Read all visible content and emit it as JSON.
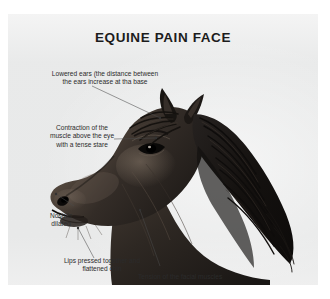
{
  "figure": {
    "title": "EQUINE PAIN FACE",
    "background_color": "#ffffff",
    "plate_color": "#e9eaea",
    "text_color": "#2b2b2b",
    "title_color": "#1c1c1c"
  },
  "annotations": [
    {
      "id": "lowered-ears",
      "text": "Lowered ears (the distance between\nthe ears increase at tha base"
    },
    {
      "id": "eye-muscle",
      "text": "Contraction of the\nmuscle above the eye\nwith a tense stare"
    },
    {
      "id": "nostrils",
      "text": "Nostrils\ndilated"
    },
    {
      "id": "lips-chin",
      "text": "Lips pressed together and\nflattened chin"
    },
    {
      "id": "facial-muscles",
      "text": "Tension of the facial muscles"
    }
  ],
  "subject": {
    "name": "horse-head-profile",
    "description": "Dark bay horse head in left-facing profile with flowing mane",
    "coat_color": "#2a2522",
    "mane_color": "#1a1715",
    "highlight_color": "#6e6258"
  }
}
